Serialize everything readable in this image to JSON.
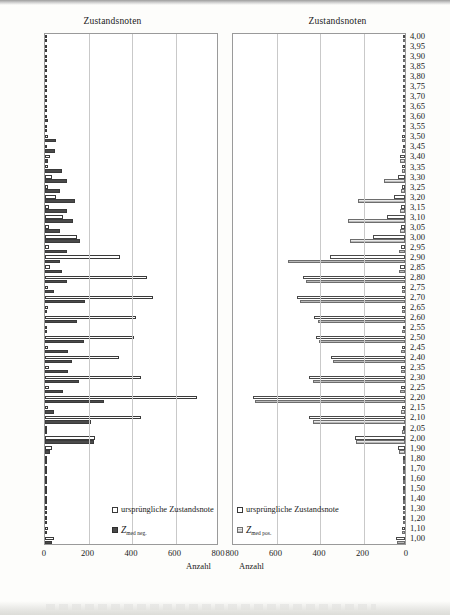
{
  "charts": [
    {
      "id": "left",
      "title": "Zustandsnoten",
      "xlabel": "Anzahl",
      "legend": [
        {
          "label": "ursprüngliche Zustandsnote",
          "marker": "open-square"
        },
        {
          "label": "Z",
          "sub": "med neg.",
          "marker": "dark-square"
        }
      ]
    },
    {
      "id": "right",
      "title": "Zustandsnoten",
      "xlabel": "Anzahl",
      "legend": [
        {
          "label": "ursprüngliche Zustandsnote",
          "marker": "open-square"
        },
        {
          "label": "Z",
          "sub": "med pos.",
          "marker": "hatched-square"
        }
      ]
    }
  ],
  "chart_data": [
    {
      "type": "bar",
      "orientation": "horizontal",
      "title": "Zustandsnoten",
      "xlabel": "Anzahl",
      "ylabel": "Zustandsnoten",
      "xlim": [
        0,
        800
      ],
      "xticks": [
        0,
        200,
        400,
        600,
        800
      ],
      "grid": true,
      "legend_position": "bottom-right-inside",
      "direction": "left-to-right",
      "categories": [
        "4,00",
        "3,95",
        "3,90",
        "3,85",
        "3,80",
        "3,75",
        "3,70",
        "3,65",
        "3,60",
        "3,55",
        "3,50",
        "3,45",
        "3,40",
        "3,35",
        "3,30",
        "3,25",
        "3,20",
        "3,15",
        "3,10",
        "3,05",
        "3,00",
        "2,95",
        "2,90",
        "2,85",
        "2,80",
        "2,75",
        "2,70",
        "2,65",
        "2,60",
        "2,55",
        "2,50",
        "2,45",
        "2,40",
        "2,35",
        "2,30",
        "2,25",
        "2,20",
        "2,15",
        "2,10",
        "2,05",
        "2,00",
        "1,90",
        "1,80",
        "1,70",
        "1,60",
        "1,50",
        "1,40",
        "1,30",
        "1,20",
        "1,10",
        "1,00"
      ],
      "series": [
        {
          "name": "ursprüngliche Zustandsnote",
          "values": [
            6,
            2,
            3,
            4,
            5,
            3,
            5,
            6,
            10,
            8,
            12,
            10,
            22,
            14,
            30,
            16,
            50,
            20,
            85,
            18,
            145,
            20,
            345,
            22,
            470,
            14,
            495,
            12,
            420,
            10,
            410,
            16,
            340,
            18,
            440,
            20,
            700,
            16,
            440,
            10,
            230,
            30,
            8,
            5,
            3,
            2,
            4,
            5,
            10,
            12,
            40
          ]
        },
        {
          "name": "Z_med neg.",
          "values": [
            4,
            2,
            2,
            3,
            4,
            3,
            4,
            6,
            14,
            10,
            50,
            48,
            16,
            80,
            100,
            70,
            140,
            100,
            130,
            70,
            160,
            100,
            70,
            80,
            100,
            40,
            185,
            10,
            145,
            6,
            180,
            105,
            125,
            105,
            155,
            85,
            270,
            40,
            210,
            5,
            225,
            22,
            8,
            4,
            2,
            2,
            3,
            4,
            8,
            10,
            30
          ]
        }
      ]
    },
    {
      "type": "bar",
      "orientation": "horizontal",
      "title": "Zustandsnoten",
      "xlabel": "Anzahl",
      "ylabel": "Zustandsnoten",
      "xlim": [
        0,
        800
      ],
      "xticks": [
        800,
        600,
        400,
        200,
        0
      ],
      "grid": true,
      "legend_position": "bottom-left-inside",
      "direction": "right-to-left",
      "categories": [
        "4,00",
        "3,95",
        "3,90",
        "3,85",
        "3,80",
        "3,75",
        "3,70",
        "3,65",
        "3,60",
        "3,55",
        "3,50",
        "3,45",
        "3,40",
        "3,35",
        "3,30",
        "3,25",
        "3,20",
        "3,15",
        "3,10",
        "3,05",
        "3,00",
        "2,95",
        "2,90",
        "2,85",
        "2,80",
        "2,75",
        "2,70",
        "2,65",
        "2,60",
        "2,55",
        "2,50",
        "2,45",
        "2,40",
        "2,35",
        "2,30",
        "2,25",
        "2,20",
        "2,15",
        "2,10",
        "2,05",
        "2,00",
        "1,90",
        "1,80",
        "1,70",
        "1,60",
        "1,50",
        "1,40",
        "1,30",
        "1,20",
        "1,10",
        "1,00"
      ],
      "series": [
        {
          "name": "ursprüngliche Zustandsnote",
          "values": [
            6,
            2,
            3,
            4,
            5,
            3,
            5,
            6,
            10,
            8,
            12,
            10,
            22,
            14,
            30,
            16,
            50,
            20,
            85,
            18,
            145,
            20,
            345,
            22,
            470,
            14,
            495,
            12,
            420,
            10,
            410,
            16,
            340,
            18,
            440,
            20,
            700,
            16,
            440,
            10,
            230,
            30,
            8,
            5,
            3,
            2,
            4,
            5,
            10,
            12,
            40
          ]
        },
        {
          "name": "Z_med pos.",
          "values": [
            5,
            2,
            3,
            4,
            5,
            3,
            5,
            6,
            10,
            8,
            14,
            12,
            24,
            16,
            95,
            20,
            215,
            24,
            260,
            22,
            255,
            26,
            540,
            28,
            455,
            16,
            485,
            14,
            400,
            12,
            395,
            18,
            330,
            20,
            425,
            22,
            690,
            18,
            425,
            12,
            225,
            28,
            8,
            5,
            3,
            2,
            4,
            5,
            10,
            12,
            38
          ]
        }
      ]
    }
  ]
}
